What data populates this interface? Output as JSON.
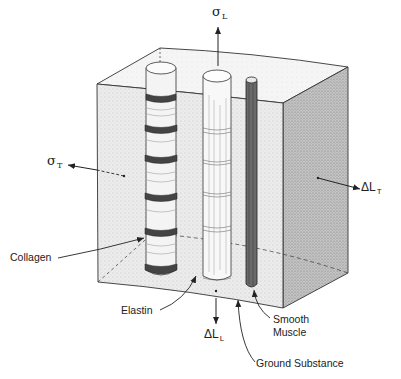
{
  "figure": {
    "colors": {
      "ink": "#222222",
      "front_face": "#eaeaea",
      "top_face": "#f3f3f3",
      "right_face": "#bdbdbd",
      "smooth_muscle": "#6a6a6a",
      "collagen_band": "#444444"
    }
  },
  "labels": {
    "sigma_L": {
      "symbol": "σ",
      "sub": "L"
    },
    "sigma_T": {
      "symbol": "σ",
      "sub": "T"
    },
    "delta_L_T": {
      "symbol": "ΔL",
      "sub": "T"
    },
    "delta_L_L": {
      "symbol": "ΔL",
      "sub": "L"
    },
    "collagen": "Collagen",
    "elastin": "Elastin",
    "smooth_muscle_line1": "Smooth",
    "smooth_muscle_line2": "Muscle",
    "ground_substance": "Ground Substance"
  }
}
